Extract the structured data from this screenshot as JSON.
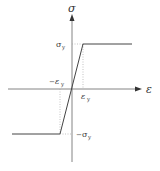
{
  "diagram": {
    "type": "stress-strain elastic-perfectly-plastic",
    "axes": {
      "y_label": "σ",
      "x_label": "ε"
    },
    "labels": {
      "sigma_y_pos": "σ",
      "sigma_y_pos_sub": "y",
      "sigma_y_neg_prefix": "−",
      "sigma_y_neg": "σ",
      "sigma_y_neg_sub": "y",
      "eps_y_pos": "ε",
      "eps_y_pos_sub": "y",
      "eps_y_neg_prefix": "−",
      "eps_y_neg": "ε",
      "eps_y_neg_sub": "y"
    },
    "colors": {
      "axis": "#555555",
      "curve": "#444444",
      "dotted": "#999999",
      "text": "#333333"
    }
  }
}
